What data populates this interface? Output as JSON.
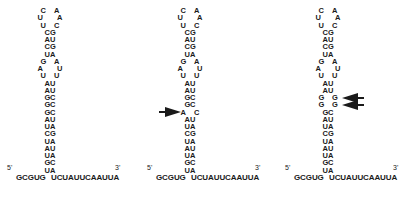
{
  "figure": {
    "structures": [
      {
        "id": "wild-type",
        "offset_x": 0,
        "center_x": 50,
        "rows": [
          [
            "C",
            "A",
            1
          ],
          [
            "U",
            "A",
            2
          ],
          [
            "U",
            "C",
            1
          ],
          [
            "C",
            "G",
            0
          ],
          [
            "A",
            "U",
            0
          ],
          [
            "C",
            "G",
            0
          ],
          [
            "U",
            "A",
            0
          ],
          [
            "G",
            "A",
            1
          ],
          [
            "A",
            "U",
            2
          ],
          [
            "U",
            "U",
            1
          ],
          [
            "A",
            "U",
            0
          ],
          [
            "A",
            "U",
            0
          ],
          [
            "G",
            "C",
            0
          ],
          [
            "G",
            "C",
            0
          ],
          [
            "G",
            "C",
            0
          ],
          [
            "A",
            "U",
            0
          ],
          [
            "U",
            "A",
            0
          ],
          [
            "C",
            "G",
            0
          ],
          [
            "U",
            "A",
            0
          ],
          [
            "A",
            "U",
            0
          ],
          [
            "U",
            "A",
            0
          ],
          [
            "G",
            "C",
            0
          ],
          [
            "U",
            "A",
            0
          ]
        ],
        "five_prime_label": "5'",
        "three_prime_label": "3'",
        "five_prime_strand": "GCGUG",
        "three_prime_strand": "UCUAUUCAAUUA",
        "arrows": []
      },
      {
        "id": "mutant-1",
        "offset_x": 140,
        "center_x": 50,
        "rows": [
          [
            "C",
            "A",
            1
          ],
          [
            "U",
            "A",
            2
          ],
          [
            "U",
            "C",
            1
          ],
          [
            "C",
            "G",
            0
          ],
          [
            "A",
            "U",
            0
          ],
          [
            "C",
            "G",
            0
          ],
          [
            "U",
            "A",
            0
          ],
          [
            "G",
            "A",
            1
          ],
          [
            "A",
            "U",
            2
          ],
          [
            "U",
            "U",
            1
          ],
          [
            "A",
            "U",
            0
          ],
          [
            "A",
            "U",
            0
          ],
          [
            "G",
            "C",
            0
          ],
          [
            "G",
            "C",
            0
          ],
          [
            "A",
            "C",
            1
          ],
          [
            "A",
            "U",
            0
          ],
          [
            "U",
            "A",
            0
          ],
          [
            "C",
            "G",
            0
          ],
          [
            "U",
            "A",
            0
          ],
          [
            "A",
            "U",
            0
          ],
          [
            "U",
            "A",
            0
          ],
          [
            "G",
            "C",
            0
          ],
          [
            "U",
            "A",
            0
          ]
        ],
        "five_prime_label": "5'",
        "three_prime_label": "3'",
        "five_prime_strand": "GCGUG",
        "three_prime_strand": "UCUAUUCAAUUA",
        "arrows": [
          {
            "row": 14,
            "side": "left"
          }
        ]
      },
      {
        "id": "mutant-2",
        "offset_x": 278,
        "center_x": 50,
        "rows": [
          [
            "C",
            "A",
            1
          ],
          [
            "U",
            "A",
            2
          ],
          [
            "U",
            "C",
            1
          ],
          [
            "C",
            "G",
            0
          ],
          [
            "A",
            "U",
            0
          ],
          [
            "C",
            "G",
            0
          ],
          [
            "U",
            "A",
            0
          ],
          [
            "G",
            "A",
            1
          ],
          [
            "A",
            "U",
            2
          ],
          [
            "U",
            "U",
            1
          ],
          [
            "A",
            "U",
            0
          ],
          [
            "A",
            "U",
            0
          ],
          [
            "G",
            "G",
            1
          ],
          [
            "G",
            "G",
            1
          ],
          [
            "G",
            "C",
            0
          ],
          [
            "A",
            "U",
            0
          ],
          [
            "U",
            "A",
            0
          ],
          [
            "C",
            "G",
            0
          ],
          [
            "U",
            "A",
            0
          ],
          [
            "A",
            "U",
            0
          ],
          [
            "U",
            "A",
            0
          ],
          [
            "G",
            "C",
            0
          ],
          [
            "U",
            "A",
            0
          ]
        ],
        "five_prime_label": "5'",
        "three_prime_label": "3'",
        "five_prime_strand": "GCGUG",
        "three_prime_strand": "UCUAUUCAAUUA",
        "arrows": [
          {
            "row": 12,
            "side": "right"
          },
          {
            "row": 13,
            "side": "right"
          }
        ]
      }
    ],
    "colors": {
      "ink": "#1a1a1a",
      "background": "#ffffff"
    }
  }
}
